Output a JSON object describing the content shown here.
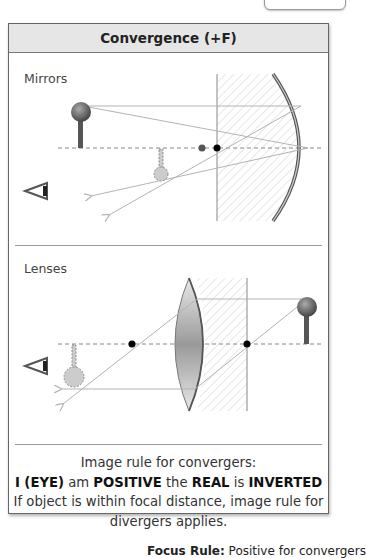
{
  "panel": {
    "title": "Convergence (+F)"
  },
  "mirrors": {
    "label": "Mirrors"
  },
  "lenses": {
    "label": "Lenses"
  },
  "rule": {
    "line1": "Image rule for convergers:",
    "line2_parts": {
      "p1": "I (EYE)",
      "p2": " am ",
      "p3": "POSITIVE",
      "p4": " the ",
      "p5": "REAL",
      "p6": " is ",
      "p7": "INVERTED"
    },
    "line3": "If object is within focal distance, image rule for",
    "line4": "divergers applies."
  },
  "footer": {
    "bold": "Focus Rule:",
    "text": " Positive for convergers"
  },
  "colors": {
    "header_bg": "#e6e6e6",
    "ray": "#b3b3b3",
    "focal_point": "#000000",
    "object": "#666666",
    "image": "#c8c8c8"
  }
}
